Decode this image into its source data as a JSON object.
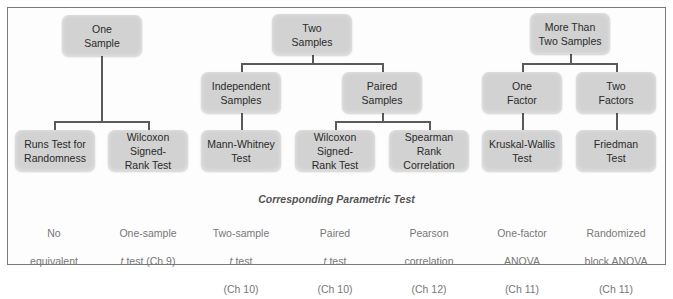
{
  "diagram": {
    "level1": [
      {
        "id": "one-sample",
        "label": "One\nSample"
      },
      {
        "id": "two-samples",
        "label": "Two\nSamples"
      },
      {
        "id": "more-than-two",
        "label": "More Than\nTwo Samples"
      }
    ],
    "level2": [
      {
        "id": "independent",
        "label": "Independent\nSamples",
        "parent": "two-samples"
      },
      {
        "id": "paired",
        "label": "Paired\nSamples",
        "parent": "two-samples"
      },
      {
        "id": "one-factor",
        "label": "One\nFactor",
        "parent": "more-than-two"
      },
      {
        "id": "two-factors",
        "label": "Two\nFactors",
        "parent": "more-than-two"
      }
    ],
    "tests": [
      {
        "id": "runs",
        "label": "Runs Test for\nRandomness",
        "parent": "one-sample"
      },
      {
        "id": "wilcoxon-1",
        "label": "Wilcoxon\nSigned-\nRank Test",
        "parent": "one-sample"
      },
      {
        "id": "mann-whitney",
        "label": "Mann-Whitney\nTest",
        "parent": "independent"
      },
      {
        "id": "wilcoxon-2",
        "label": "Wilcoxon\nSigned-\nRank Test",
        "parent": "paired"
      },
      {
        "id": "spearman",
        "label": "Spearman\nRank\nCorrelation",
        "parent": "paired"
      },
      {
        "id": "kruskal",
        "label": "Kruskal-Wallis\nTest",
        "parent": "one-factor"
      },
      {
        "id": "friedman",
        "label": "Friedman\nTest",
        "parent": "two-factors"
      }
    ],
    "caption": "Corresponding Parametric Test",
    "parametric": [
      {
        "line1": "No",
        "line2": "equivalent",
        "line3": ""
      },
      {
        "line1": "One-sample",
        "italic": "t",
        "line2": " test (Ch 9)",
        "line3": ""
      },
      {
        "line1": "Two-sample",
        "italic": "t",
        "line2": " test",
        "line3": "(Ch 10)"
      },
      {
        "line1": "Paired",
        "italic": "t",
        "line2": " test",
        "line3": "(Ch 10)"
      },
      {
        "line1": "Pearson",
        "line2": "correlation",
        "line3": "(Ch 12)"
      },
      {
        "line1": "One-factor",
        "line2": "ANOVA",
        "line3": "(Ch 11)"
      },
      {
        "line1": "Randomized",
        "line2": "block ANOVA",
        "line3": "(Ch 11)"
      }
    ],
    "colors": {
      "box_fill": "#d2d2d2",
      "line": "#5a5a5a",
      "frame": "#7a7a7a",
      "param_text": "#777777"
    }
  }
}
